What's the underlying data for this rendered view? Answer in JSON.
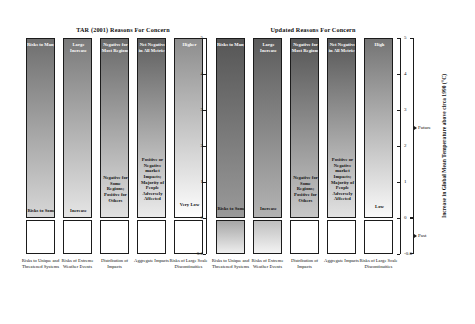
{
  "figure": {
    "panels": [
      {
        "id": "tar",
        "title": "TAR (2001) Reasons For Concern",
        "columns": [
          {
            "category": "Risks to Unique and Threatened Systems",
            "top_label": "Risks to Many",
            "bottom_label": "Risks to Some",
            "bottom_label_y_c": 0.15,
            "future_fill_top_c": 5.0,
            "future_fill_bottom_c": 0.0,
            "future_top_color": "#6f6f6f",
            "future_bottom_color": "#d8d8d8",
            "past_fill": false
          },
          {
            "category": "Risks of Extreme Weather Events",
            "top_label": "Large Increase",
            "bottom_label": "Increase",
            "bottom_label_y_c": 0.15,
            "future_fill_top_c": 5.0,
            "future_fill_bottom_c": 0.0,
            "future_top_color": "#7a7a7a",
            "future_bottom_color": "#e6e6e6",
            "past_fill": false
          },
          {
            "category": "Distribution of Impacts",
            "top_label": "Negative for Most Regions",
            "bottom_label": "Negative for Some Regions; Positive for Others",
            "bottom_label_y_c": 1.05,
            "future_fill_top_c": 5.0,
            "future_fill_bottom_c": 0.0,
            "future_top_color": "#6a6a6a",
            "future_bottom_color": "#e2e2e2",
            "past_fill": false
          },
          {
            "category": "Aggregate Impacts",
            "top_label": "Net Negative in All Metrics",
            "bottom_label": "Positive or Negative market Impacts; Majority of People Adversely Affected",
            "bottom_label_y_c": 1.55,
            "future_fill_top_c": 5.0,
            "future_fill_bottom_c": 0.0,
            "future_top_color": "#5e5e5e",
            "future_bottom_color": "#ededed",
            "past_fill": false
          },
          {
            "category": "Risks of Large Scale Discontinuities",
            "top_label": "Higher",
            "bottom_label": "Very Low",
            "bottom_label_y_c": 0.3,
            "future_fill_top_c": 5.0,
            "future_fill_bottom_c": 0.0,
            "future_top_color": "#8d8d8d",
            "future_bottom_color": "#ffffff",
            "past_fill": false
          }
        ]
      },
      {
        "id": "updated",
        "title": "Updated Reasons For Concern",
        "columns": [
          {
            "category": "Risks to Unique and Threatened Systems",
            "top_label": "Risks to Many",
            "bottom_label": "Risks to Some",
            "bottom_label_y_c": 0.2,
            "future_fill_top_c": 5.0,
            "future_fill_bottom_c": 0.0,
            "future_top_color": "#565656",
            "future_bottom_color": "#9a9a9a",
            "past_fill": true,
            "past_top_color": "#a6a6a6",
            "past_bottom_color": "#f2f2f2"
          },
          {
            "category": "Risks of Extreme Weather Events",
            "top_label": "Large Increase",
            "bottom_label": "Increase",
            "bottom_label_y_c": 0.2,
            "future_fill_top_c": 5.0,
            "future_fill_bottom_c": 0.0,
            "future_top_color": "#5c5c5c",
            "future_bottom_color": "#b4b4b4",
            "past_fill": true,
            "past_top_color": "#bfbfbf",
            "past_bottom_color": "#f6f6f6"
          },
          {
            "category": "Distribution of Impacts",
            "top_label": "Negative for Most Regions",
            "bottom_label": "Negative for Some Regions; Positive for Others",
            "bottom_label_y_c": 1.05,
            "future_fill_top_c": 5.0,
            "future_fill_bottom_c": 0.0,
            "future_top_color": "#555555",
            "future_bottom_color": "#c9c9c9",
            "past_fill": false
          },
          {
            "category": "Aggregate Impacts",
            "top_label": "Net Negative in All Metrics",
            "bottom_label": "Positive or Negative market Impacts; Majority of People Adversely Affected",
            "bottom_label_y_c": 1.55,
            "future_fill_top_c": 5.0,
            "future_fill_bottom_c": 0.0,
            "future_top_color": "#575757",
            "future_bottom_color": "#e4e4e4",
            "past_fill": false
          },
          {
            "category": "Risks of Large Scale Discontinuities",
            "top_label": "High",
            "bottom_label": "Low",
            "bottom_label_y_c": 0.25,
            "future_fill_top_c": 5.0,
            "future_fill_bottom_c": 0.0,
            "future_top_color": "#747474",
            "future_bottom_color": "#fbfbfb",
            "past_fill": false
          }
        ]
      }
    ],
    "y_axis": {
      "title": "Increase in Global Mean Temperature above circa 1990 (°C)",
      "ticks": [
        "5",
        "4",
        "3",
        "2",
        "1",
        "0",
        "-0.6"
      ],
      "tick_values": [
        5,
        4,
        3,
        2,
        1,
        0,
        -0.6
      ],
      "range": [
        -0.6,
        5
      ]
    },
    "brackets": [
      {
        "label": "Future",
        "from_c": 0,
        "to_c": 5
      },
      {
        "label": "Past",
        "from_c": -0.6,
        "to_c": 0
      }
    ],
    "colors": {
      "line": "#1b1b1b",
      "background": "#ffffff",
      "ember_dark": "#565656",
      "ember_light": "#ffffff"
    }
  },
  "chart_data": {
    "type": "heatmap",
    "ylabel": "Increase in Global Mean Temperature above circa 1990 (°C)",
    "ylim": [
      -0.6,
      5
    ],
    "ytick_labels": [
      "5",
      "4",
      "3",
      "2",
      "1",
      "0",
      "-0.6"
    ],
    "xlabel": "",
    "grid": false,
    "legend": "none",
    "categories": [
      "Risks to Unique and Threatened Systems",
      "Risks of Extreme Weather Events",
      "Distribution of Impacts",
      "Aggregate Impacts",
      "Risks of Large Scale Discontinuities"
    ],
    "series": [
      {
        "name": "TAR (2001) Reasons For Concern",
        "annotations_top": [
          "Risks to Many",
          "Large Increase",
          "Negative for Most Regions",
          "Net Negative in All Metrics",
          "Higher"
        ],
        "annotations_bottom": [
          "Risks to Some",
          "Increase",
          "Negative for Some Regions; Positive for Others",
          "Positive or Negative market Impacts; Majority of People Adversely Affected",
          "Very Low"
        ],
        "values": [
          {
            "category": "Risks to Unique and Threatened Systems",
            "shading_from_c": 0.0,
            "shading_to_c": 5.0,
            "intensity_at_0c": 0.15,
            "intensity_at_5c": 0.58
          },
          {
            "category": "Risks of Extreme Weather Events",
            "shading_from_c": 0.0,
            "shading_to_c": 5.0,
            "intensity_at_0c": 0.1,
            "intensity_at_5c": 0.53
          },
          {
            "category": "Distribution of Impacts",
            "shading_from_c": 0.0,
            "shading_to_c": 5.0,
            "intensity_at_0c": 0.11,
            "intensity_at_5c": 0.59
          },
          {
            "category": "Aggregate Impacts",
            "shading_from_c": 0.0,
            "shading_to_c": 5.0,
            "intensity_at_0c": 0.07,
            "intensity_at_5c": 0.63
          },
          {
            "category": "Risks of Large Scale Discontinuities",
            "shading_from_c": 0.0,
            "shading_to_c": 5.0,
            "intensity_at_0c": 0.0,
            "intensity_at_5c": 0.45
          }
        ]
      },
      {
        "name": "Updated Reasons For Concern",
        "annotations_top": [
          "Risks to Many",
          "Large Increase",
          "Negative for Most Regions",
          "Net Negative in All Metrics",
          "High"
        ],
        "annotations_bottom": [
          "Risks to Some",
          "Increase",
          "Negative for Some Regions; Positive for Others",
          "Positive or Negative market Impacts; Majority of People Adversely Affected",
          "Low"
        ],
        "values": [
          {
            "category": "Risks to Unique and Threatened Systems",
            "shading_from_c": -0.6,
            "shading_to_c": 5.0,
            "intensity_at_minus06c": 0.05,
            "intensity_at_0c": 0.4,
            "intensity_at_5c": 0.66
          },
          {
            "category": "Risks of Extreme Weather Events",
            "shading_from_c": -0.6,
            "shading_to_c": 5.0,
            "intensity_at_minus06c": 0.03,
            "intensity_at_0c": 0.29,
            "intensity_at_5c": 0.64
          },
          {
            "category": "Distribution of Impacts",
            "shading_from_c": 0.0,
            "shading_to_c": 5.0,
            "intensity_at_0c": 0.21,
            "intensity_at_5c": 0.67
          },
          {
            "category": "Aggregate Impacts",
            "shading_from_c": 0.0,
            "shading_to_c": 5.0,
            "intensity_at_0c": 0.11,
            "intensity_at_5c": 0.66
          },
          {
            "category": "Risks of Large Scale Discontinuities",
            "shading_from_c": 0.0,
            "shading_to_c": 5.0,
            "intensity_at_0c": 0.02,
            "intensity_at_5c": 0.55
          }
        ]
      }
    ],
    "bracket_annotations": [
      {
        "label": "Future",
        "from_c": 0,
        "to_c": 5
      },
      {
        "label": "Past",
        "from_c": -0.6,
        "to_c": 0
      }
    ]
  }
}
